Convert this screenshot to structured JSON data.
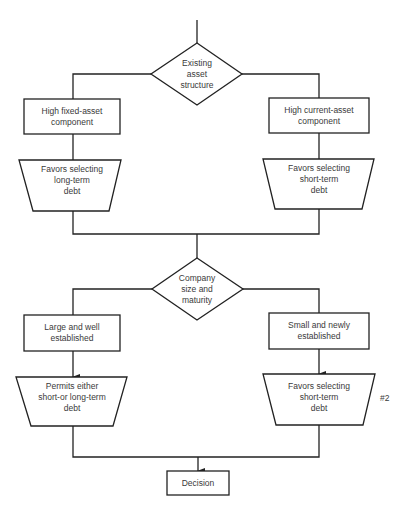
{
  "diagram": {
    "stroke_color": "#222222",
    "text_color": "#3a3a3a",
    "background": "#ffffff",
    "nodes": {
      "decision1": {
        "shape": "diamond",
        "lines": [
          "Existing",
          "asset",
          "structure"
        ]
      },
      "box_left1": {
        "shape": "rectangle",
        "lines": [
          "High fixed-asset",
          "component"
        ]
      },
      "box_right1": {
        "shape": "rectangle",
        "lines": [
          "High current-asset",
          "component"
        ]
      },
      "trap_left1": {
        "shape": "trapezoid",
        "lines": [
          "Favors selecting",
          "long-term",
          "debt"
        ]
      },
      "trap_right1": {
        "shape": "trapezoid",
        "lines": [
          "Favors selecting",
          "short-term",
          "debt"
        ]
      },
      "decision2": {
        "shape": "diamond",
        "lines": [
          "Company",
          "size and",
          "maturity"
        ]
      },
      "box_left2": {
        "shape": "rectangle",
        "lines": [
          "Large and well",
          "established"
        ]
      },
      "box_right2": {
        "shape": "rectangle",
        "lines": [
          "Small and newly",
          "established"
        ]
      },
      "trap_left2": {
        "shape": "trapezoid",
        "lines": [
          "Permits either",
          "short-or long-term",
          "debt"
        ]
      },
      "trap_right2": {
        "shape": "trapezoid",
        "lines": [
          "Favors selecting",
          "short-term",
          "debt"
        ]
      },
      "final": {
        "shape": "rectangle",
        "lines": [
          "Decision"
        ]
      }
    },
    "annotation": "#2"
  }
}
